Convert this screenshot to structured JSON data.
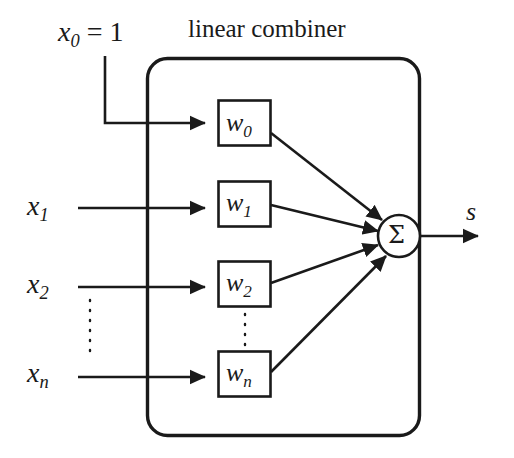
{
  "diagram": {
    "title": "linear combiner",
    "kind": "linear-combiner-neuron-schematic",
    "bias_input": {
      "variable": "x",
      "subscript": "0",
      "equals": " = 1",
      "full_text": "x0 = 1"
    },
    "inputs": [
      {
        "id": "x1",
        "variable": "x",
        "subscript": "1"
      },
      {
        "id": "x2",
        "variable": "x",
        "subscript": "2"
      },
      {
        "id": "xn",
        "variable": "x",
        "subscript": "n"
      }
    ],
    "weights": [
      {
        "id": "w0",
        "variable": "w",
        "subscript": "0"
      },
      {
        "id": "w1",
        "variable": "w",
        "subscript": "1"
      },
      {
        "id": "w2",
        "variable": "w",
        "subscript": "2"
      },
      {
        "id": "wn",
        "variable": "w",
        "subscript": "n"
      }
    ],
    "summation": {
      "symbol": "Σ",
      "name": "summing-junction"
    },
    "output": {
      "label": "s",
      "name": "output-signal"
    },
    "ellipsis_marks": [
      {
        "name": "input-vertical-ellipsis",
        "between": [
          "x2",
          "xn"
        ]
      },
      {
        "name": "weight-vertical-ellipsis",
        "between": [
          "w2",
          "wn"
        ]
      }
    ],
    "colors": {
      "ink": "#1a1a1a",
      "background": "#ffffff"
    }
  }
}
